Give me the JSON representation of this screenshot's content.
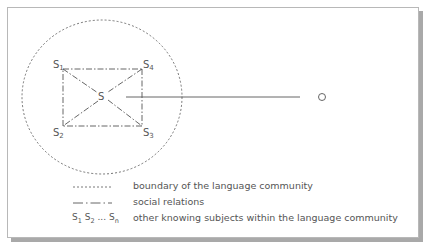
{
  "diagram": {
    "nodes": {
      "center": {
        "label": "S"
      },
      "s1": {
        "label": "S",
        "sub": "1"
      },
      "s2": {
        "label": "S",
        "sub": "2"
      },
      "s3": {
        "label": "S",
        "sub": "3"
      },
      "s4": {
        "label": "S",
        "sub": "4"
      },
      "external": {
        "label": "O"
      }
    },
    "colors": {
      "line": "#555555",
      "frame_border": "#b8b8b8",
      "shadow": "#a9a9a9"
    }
  },
  "legend": {
    "items": [
      {
        "symbol": "dotted-line",
        "text": "boundary of the language community"
      },
      {
        "symbol": "dash-dot-line",
        "text": "social relations"
      },
      {
        "symbol": "S₁ S₂ … Sₙ",
        "text": "other knowing subjects within the language community"
      }
    ],
    "subjects_symbol": {
      "s": "S",
      "sub1": "1",
      "sub2": "2",
      "subn": "n",
      "dots": "..."
    }
  }
}
